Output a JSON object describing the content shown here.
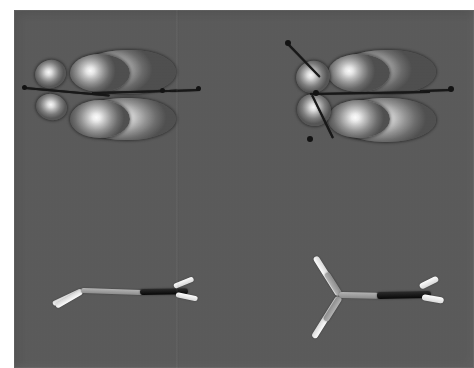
{
  "figure": {
    "background_color": "#5a5a5a",
    "page_color": "#ffffff",
    "canvas": {
      "x": 14,
      "y": 10,
      "width": 460,
      "height": 358
    }
  },
  "panels": [
    {
      "id": "top-left",
      "name": "orbital-plot-left",
      "label": "",
      "kind": "orbital-isosurface",
      "lobe_count": 4,
      "lobe_colors": [
        "#ffffff",
        "#bdbdbd",
        "#6a6a6a",
        "#4e4e4e"
      ]
    },
    {
      "id": "top-right",
      "name": "orbital-plot-right",
      "label": "",
      "kind": "orbital-isosurface",
      "lobe_count": 4,
      "lobe_colors": [
        "#ffffff",
        "#c6c6c6",
        "#6d6d6d",
        "#4f4f4f"
      ]
    },
    {
      "id": "bottom-left",
      "name": "molecule-model-left",
      "label": "",
      "kind": "ball-and-stick",
      "bond_colors": {
        "light": "#f2f2f2",
        "gray": "#9a9a9a",
        "black": "#121212"
      }
    },
    {
      "id": "bottom-right",
      "name": "molecule-model-right",
      "label": "",
      "kind": "ball-and-stick",
      "bond_colors": {
        "light": "#f2f2f2",
        "gray": "#9a9a9a",
        "black": "#121212"
      }
    }
  ]
}
